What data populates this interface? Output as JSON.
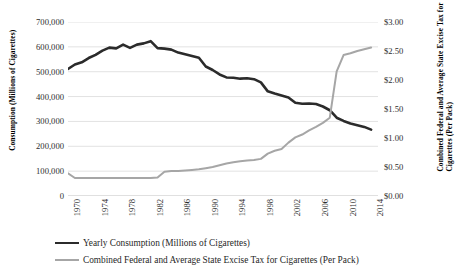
{
  "chart_data": {
    "type": "line",
    "title": "",
    "xlabel": "",
    "ylabel": "Consumption (Millions of Cigarettes)",
    "y2label": "Combined Federal and Average State Excise Tax for\nCigarettes (Per Pack)",
    "grid": true,
    "legend_position": "bottom",
    "xlim": [
      1970,
      2015
    ],
    "ylim": [
      0,
      700000
    ],
    "y2lim": [
      0,
      3.0
    ],
    "yticks": [
      0,
      100000,
      200000,
      300000,
      400000,
      500000,
      600000,
      700000
    ],
    "ytick_labels": [
      "0",
      "100,000",
      "200,000",
      "300,000",
      "400,000",
      "500,000",
      "600,000",
      "700,000"
    ],
    "y2ticks": [
      0,
      0.5,
      1.0,
      1.5,
      2.0,
      2.5,
      3.0
    ],
    "y2tick_labels": [
      "$0.00",
      "$0.50",
      "$1.00",
      "$1.50",
      "$2.00",
      "$2.50",
      "$3.00"
    ],
    "xticks": [
      1970,
      1974,
      1978,
      1982,
      1986,
      1990,
      1994,
      1998,
      2002,
      2006,
      2010,
      2014
    ],
    "xtick_labels": [
      "1970",
      "1974",
      "1978",
      "1982",
      "1986",
      "1990",
      "1994",
      "1998",
      "2002",
      "2006",
      "2010",
      "2014"
    ],
    "x": [
      1970,
      1971,
      1972,
      1973,
      1974,
      1975,
      1976,
      1977,
      1978,
      1979,
      1980,
      1981,
      1982,
      1983,
      1984,
      1985,
      1986,
      1987,
      1988,
      1989,
      1990,
      1991,
      1992,
      1993,
      1994,
      1995,
      1996,
      1997,
      1998,
      1999,
      2000,
      2001,
      2002,
      2003,
      2004,
      2005,
      2006,
      2007,
      2008,
      2009,
      2010,
      2011,
      2012,
      2013,
      2014
    ],
    "series": [
      {
        "name": "Yearly Consumption (Millions of Cigarettes)",
        "axis": "left",
        "color": "#2b2b2b",
        "values": [
          511000,
          529000,
          538000,
          555000,
          568000,
          585000,
          597000,
          594000,
          609000,
          596000,
          609000,
          614000,
          623000,
          595000,
          593000,
          589000,
          577000,
          570000,
          563000,
          556000,
          521000,
          507000,
          489000,
          477000,
          476000,
          472000,
          474000,
          470000,
          457000,
          421000,
          412000,
          404000,
          396000,
          375000,
          371000,
          372000,
          370000,
          360000,
          345000,
          315000,
          302000,
          292000,
          285000,
          278000,
          267000
        ]
      },
      {
        "name": "Combined Federal and Average State Excise Tax for Cigarettes (Per Pack)",
        "axis": "right",
        "color": "#a6a6a6",
        "values": [
          0.39,
          0.31,
          0.31,
          0.31,
          0.31,
          0.31,
          0.31,
          0.31,
          0.31,
          0.31,
          0.31,
          0.31,
          0.31,
          0.32,
          0.42,
          0.43,
          0.43,
          0.44,
          0.45,
          0.46,
          0.48,
          0.5,
          0.53,
          0.56,
          0.58,
          0.6,
          0.61,
          0.62,
          0.64,
          0.73,
          0.78,
          0.81,
          0.92,
          1.01,
          1.06,
          1.13,
          1.19,
          1.26,
          1.35,
          2.15,
          2.43,
          2.46,
          2.5,
          2.53,
          2.56
        ]
      }
    ]
  },
  "legend": {
    "items": [
      {
        "label": "Yearly Consumption (Millions of Cigarettes)",
        "swatch": "dark-line-swatch"
      },
      {
        "label": "Combined Federal and Average State Excise Tax for Cigarettes (Per Pack)",
        "swatch": "gray-line-swatch"
      }
    ]
  }
}
